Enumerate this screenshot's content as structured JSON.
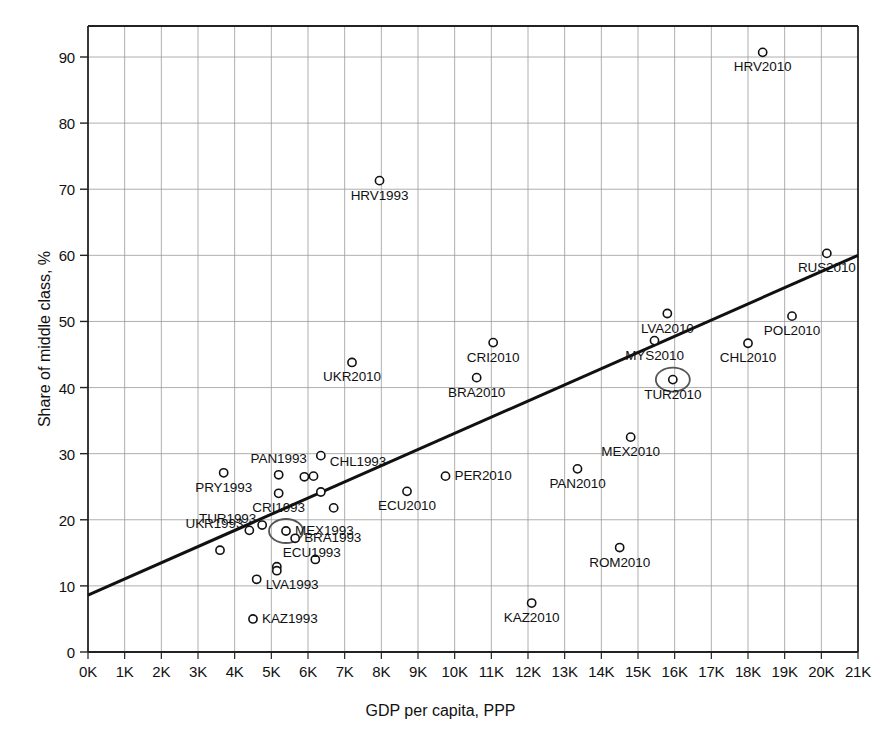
{
  "chart_data": {
    "type": "scatter",
    "title": "",
    "xlabel": "GDP per capita, PPP",
    "ylabel": "Share of middle class, %",
    "xlim": [
      0,
      21000
    ],
    "ylim": [
      0,
      95
    ],
    "grid": true,
    "legend": "none",
    "x_tick_labels": [
      "0K",
      "1K",
      "2K",
      "3K",
      "4K",
      "5K",
      "6K",
      "7K",
      "8K",
      "9K",
      "10K",
      "11K",
      "12K",
      "13K",
      "14K",
      "15K",
      "16K",
      "17K",
      "18K",
      "19K",
      "20K",
      "21K"
    ],
    "x_tick_values": [
      0,
      1000,
      2000,
      3000,
      4000,
      5000,
      6000,
      7000,
      8000,
      9000,
      10000,
      11000,
      12000,
      13000,
      14000,
      15000,
      16000,
      17000,
      18000,
      19000,
      20000,
      21000
    ],
    "y_tick_labels": [
      "0",
      "10",
      "20",
      "30",
      "40",
      "50",
      "60",
      "70",
      "80",
      "90"
    ],
    "y_tick_values": [
      0,
      10,
      20,
      30,
      40,
      50,
      60,
      70,
      80,
      90
    ],
    "marker": "open-circle",
    "marker_color": "#111111",
    "trendline": {
      "color": "#111111",
      "x0": 0,
      "y0": 8.6,
      "x1": 21000,
      "y1": 60.0,
      "width": 3
    },
    "highlight_color": "#555555",
    "points": [
      {
        "label": "HRV2010",
        "x": 18400,
        "y": 90.7,
        "label_pos": "below"
      },
      {
        "label": "HRV1993",
        "x": 7950,
        "y": 71.3,
        "label_pos": "below"
      },
      {
        "label": "RUS2010",
        "x": 20150,
        "y": 60.3,
        "label_pos": "below"
      },
      {
        "label": "LVA2010",
        "x": 15800,
        "y": 51.2,
        "label_pos": "below"
      },
      {
        "label": "POL2010",
        "x": 19200,
        "y": 50.8,
        "label_pos": "below"
      },
      {
        "label": "MYS2010",
        "x": 15450,
        "y": 47.1,
        "label_pos": "below"
      },
      {
        "label": "CRI2010",
        "x": 11050,
        "y": 46.8,
        "label_pos": "below"
      },
      {
        "label": "CHL2010",
        "x": 18000,
        "y": 46.7,
        "label_pos": "below"
      },
      {
        "label": "UKR2010",
        "x": 7200,
        "y": 43.8,
        "label_pos": "below"
      },
      {
        "label": "BRA2010",
        "x": 10600,
        "y": 41.5,
        "label_pos": "below"
      },
      {
        "label": "TUR2010",
        "x": 15950,
        "y": 41.2,
        "label_pos": "below",
        "highlight": true
      },
      {
        "label": "MEX2010",
        "x": 14800,
        "y": 32.5,
        "label_pos": "below"
      },
      {
        "label": "CHL1993",
        "x": 6350,
        "y": 29.7,
        "label_pos": "right-below"
      },
      {
        "label": "PAN2010",
        "x": 13350,
        "y": 27.7,
        "label_pos": "below"
      },
      {
        "label": "PRY1993",
        "x": 3700,
        "y": 27.1,
        "label_pos": "below"
      },
      {
        "label": "PAN1993",
        "x": 5200,
        "y": 26.8,
        "label_pos": "above"
      },
      {
        "label": "",
        "x": 5900,
        "y": 26.5,
        "label_pos": "none"
      },
      {
        "label": "",
        "x": 6150,
        "y": 26.6,
        "label_pos": "none"
      },
      {
        "label": "PER2010",
        "x": 9750,
        "y": 26.6,
        "label_pos": "right"
      },
      {
        "label": "CRI1993",
        "x": 5200,
        "y": 24.0,
        "label_pos": "below"
      },
      {
        "label": "",
        "x": 6350,
        "y": 24.2,
        "label_pos": "none"
      },
      {
        "label": "ECU2010",
        "x": 8700,
        "y": 24.3,
        "label_pos": "below"
      },
      {
        "label": "",
        "x": 6700,
        "y": 21.8,
        "label_pos": "none"
      },
      {
        "label": "TUR1993",
        "x": 4750,
        "y": 19.2,
        "label_pos": "left"
      },
      {
        "label": "MEX1993",
        "x": 5400,
        "y": 18.3,
        "label_pos": "right",
        "highlight": true
      },
      {
        "label": "BRA1993",
        "x": 5650,
        "y": 17.2,
        "label_pos": "right"
      },
      {
        "label": "UKR1993",
        "x": 4400,
        "y": 18.4,
        "label_pos": "left"
      },
      {
        "label": "ROM2010",
        "x": 14500,
        "y": 15.8,
        "label_pos": "below"
      },
      {
        "label": "",
        "x": 3600,
        "y": 15.4,
        "label_pos": "none"
      },
      {
        "label": "",
        "x": 6200,
        "y": 14.0,
        "label_pos": "none"
      },
      {
        "label": "ECU1993",
        "x": 5150,
        "y": 12.9,
        "label_pos": "left-above"
      },
      {
        "label": "",
        "x": 5150,
        "y": 12.3,
        "label_pos": "none"
      },
      {
        "label": "LVA1993",
        "x": 4600,
        "y": 11.0,
        "label_pos": "right-below"
      },
      {
        "label": "KAZ2010",
        "x": 12100,
        "y": 7.4,
        "label_pos": "below"
      },
      {
        "label": "KAZ1993",
        "x": 4500,
        "y": 5.0,
        "label_pos": "right"
      }
    ]
  }
}
